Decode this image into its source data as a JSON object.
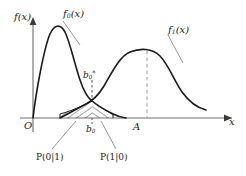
{
  "figure": {
    "background": "#ffffff",
    "ink": "#1a1a1a",
    "guide_color": "#9a9a9a"
  },
  "axes": {
    "origin_label": "O",
    "y_axis_label": "f(x)",
    "x_axis_label": "x",
    "x_axis_y_px": 118,
    "y_axis_x_px": 33,
    "x_axis_arrow": "right-arrow-icon",
    "y_axis_arrow": "up-arrow-icon"
  },
  "curves": [
    {
      "name": "f0",
      "label": "f₀(x)",
      "label_base": "f",
      "label_sub": "0",
      "label_tail": "(x)",
      "shape": "rayleigh",
      "peak_x_px": 57,
      "peak_y_px": 27,
      "start_x_px": 33,
      "end_x_px": 120,
      "leader": {
        "from_x": 62,
        "from_y": 20,
        "to_x": 80,
        "to_y": 45
      }
    },
    {
      "name": "f1",
      "label": "f₁(x)",
      "label_base": "f",
      "label_sub": "1",
      "label_tail": "(x)",
      "shape": "gaussian",
      "peak_x_px": 147,
      "peak_y_px": 51,
      "start_x_px": 63,
      "end_x_px": 205,
      "leader": {
        "from_x": 167,
        "from_y": 33,
        "to_x": 183,
        "to_y": 62
      }
    }
  ],
  "markers": {
    "threshold_star": {
      "label": "b₀*",
      "label_base": "b",
      "label_sub": "0",
      "label_star": "*",
      "x_px": 92,
      "y_px": 69,
      "dash_to_y_px": 104
    },
    "threshold": {
      "label": "b₀",
      "label_base": "b",
      "label_sub": "0",
      "x_px": 92,
      "y_px": 124,
      "tick_from_y_px": 118,
      "tick_to_y_px": 123
    },
    "signal_amplitude": {
      "label": "A",
      "x_px": 147,
      "y_px": 121,
      "dashed_line_from_y_px": 51,
      "dashed_line_to_y_px": 118
    }
  },
  "error_regions": [
    {
      "name": "miss",
      "label": "P(0|1)",
      "hatch": "diagonal-down",
      "from_x_px": 60,
      "to_x_px": 92,
      "leader": {
        "from_x": 52,
        "from_y": 149,
        "to_x": 76,
        "to_y": 121
      }
    },
    {
      "name": "false-alarm",
      "label": "P(1|0)",
      "hatch": "diagonal-up",
      "from_x_px": 92,
      "to_x_px": 113,
      "leader": {
        "from_x": 116,
        "from_y": 149,
        "to_x": 101,
        "to_y": 121
      }
    }
  ]
}
